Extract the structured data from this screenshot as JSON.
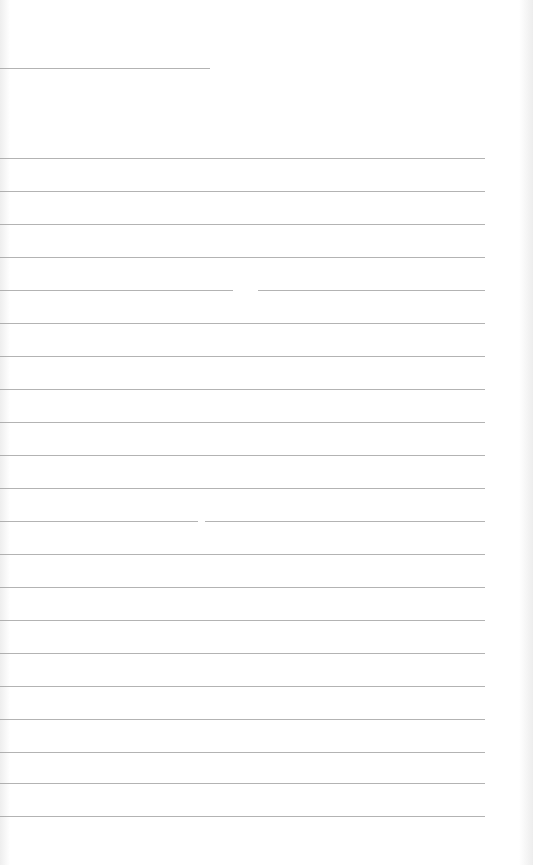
{
  "page": {
    "type": "lined-paper",
    "background_color": "#ffffff",
    "line_color": "#9a9a9a",
    "text_content": ""
  },
  "lines": {
    "header_line": {
      "y": 68,
      "x_start": 0,
      "x_end": 210
    },
    "ruled_lines": [
      {
        "y": 158,
        "segments": [
          [
            0,
            485
          ]
        ]
      },
      {
        "y": 191,
        "segments": [
          [
            0,
            485
          ]
        ]
      },
      {
        "y": 224,
        "segments": [
          [
            0,
            485
          ]
        ]
      },
      {
        "y": 257,
        "segments": [
          [
            0,
            485
          ]
        ]
      },
      {
        "y": 290,
        "segments": [
          [
            0,
            233
          ],
          [
            258,
            485
          ]
        ]
      },
      {
        "y": 323,
        "segments": [
          [
            0,
            485
          ]
        ]
      },
      {
        "y": 356,
        "segments": [
          [
            0,
            485
          ]
        ]
      },
      {
        "y": 389,
        "segments": [
          [
            0,
            485
          ]
        ]
      },
      {
        "y": 422,
        "segments": [
          [
            0,
            485
          ]
        ]
      },
      {
        "y": 455,
        "segments": [
          [
            0,
            485
          ]
        ]
      },
      {
        "y": 488,
        "segments": [
          [
            0,
            485
          ]
        ]
      },
      {
        "y": 521,
        "segments": [
          [
            0,
            198
          ],
          [
            205,
            485
          ]
        ]
      },
      {
        "y": 554,
        "segments": [
          [
            0,
            485
          ]
        ]
      },
      {
        "y": 587,
        "segments": [
          [
            0,
            485
          ]
        ]
      },
      {
        "y": 620,
        "segments": [
          [
            0,
            485
          ]
        ]
      },
      {
        "y": 653,
        "segments": [
          [
            0,
            485
          ]
        ]
      },
      {
        "y": 686,
        "segments": [
          [
            0,
            485
          ]
        ]
      },
      {
        "y": 719,
        "segments": [
          [
            0,
            485
          ]
        ]
      },
      {
        "y": 752,
        "segments": [
          [
            0,
            485
          ]
        ]
      },
      {
        "y": 783,
        "segments": [
          [
            0,
            485
          ]
        ]
      },
      {
        "y": 816,
        "segments": [
          [
            0,
            485
          ]
        ]
      }
    ]
  }
}
